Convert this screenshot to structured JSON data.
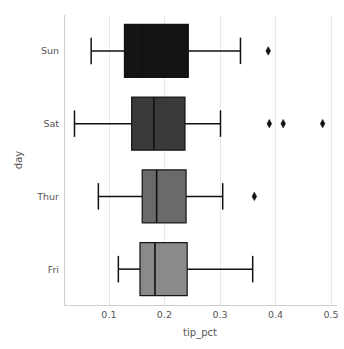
{
  "chart_data": {
    "type": "box",
    "title": "",
    "xlabel": "tip_pct",
    "ylabel": "day",
    "orientation": "horizontal",
    "xlim": [
      0.02,
      0.51
    ],
    "xticks": [
      0.1,
      0.2,
      0.3,
      0.4,
      0.5
    ],
    "xtick_labels": [
      "0.1",
      "0.2",
      "0.3",
      "0.4",
      "0.5"
    ],
    "categories": [
      "Sun",
      "Sat",
      "Thur",
      "Fri"
    ],
    "grid": "vertical",
    "legend": "none",
    "boxes": [
      {
        "category": "Sun",
        "fill": "#141414",
        "whisker_low": 0.068,
        "q1": 0.128,
        "median": 0.159,
        "q3": 0.243,
        "whisker_high": 0.337,
        "outliers": [
          0.387
        ]
      },
      {
        "category": "Sat",
        "fill": "#3a3a3a",
        "whisker_low": 0.038,
        "q1": 0.141,
        "median": 0.181,
        "q3": 0.237,
        "whisker_high": 0.301,
        "outliers": [
          0.389,
          0.414,
          0.485
        ]
      },
      {
        "category": "Thur",
        "fill": "#6a6a6a",
        "whisker_low": 0.081,
        "q1": 0.16,
        "median": 0.186,
        "q3": 0.239,
        "whisker_high": 0.305,
        "outliers": [
          0.362
        ]
      },
      {
        "category": "Fri",
        "fill": "#8a8a8a",
        "whisker_low": 0.117,
        "q1": 0.156,
        "median": 0.183,
        "q3": 0.241,
        "whisker_high": 0.359,
        "outliers": []
      }
    ]
  },
  "axes": {
    "x_title": "tip_pct",
    "y_title": "day",
    "x_tick_0": "0.1",
    "x_tick_1": "0.2",
    "x_tick_2": "0.3",
    "x_tick_3": "0.4",
    "x_tick_4": "0.5",
    "y_tick_0": "Sun",
    "y_tick_1": "Sat",
    "y_tick_2": "Thur",
    "y_tick_3": "Fri"
  },
  "colors": {
    "grid": "#e9e9e9",
    "spine": "#cfcfcf",
    "ink": "#111111",
    "tick_text": "#555555",
    "background": "#ffffff"
  }
}
